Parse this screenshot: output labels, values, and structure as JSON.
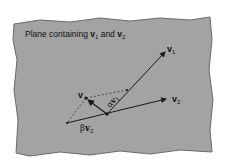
{
  "title_prefix": "Plane containing ",
  "title_v1": "v",
  "title_v1_sub": "1",
  "title_and": " and ",
  "title_v2": "v",
  "title_v2_sub": "2",
  "labels": {
    "v1": "v",
    "v1_sub": "1",
    "v2": "v",
    "v2_sub": "2",
    "v": "v",
    "alpha": "α",
    "alpha_v": "v",
    "alpha_sub": "1",
    "beta": "β",
    "beta_v": "v",
    "beta_sub": "2"
  },
  "colors": {
    "plane": "#a3a3a3",
    "plane_edge": "#6a6a6a",
    "line": "#1a1a1a"
  }
}
